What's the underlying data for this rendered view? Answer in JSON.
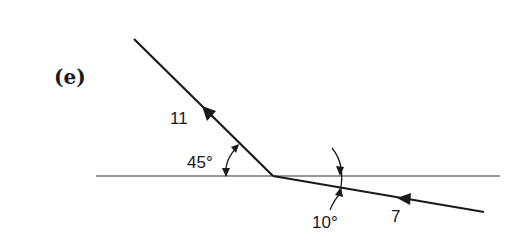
{
  "figure": {
    "part_label": "(e)",
    "colors": {
      "ink": "#1a1a1a",
      "background": "#ffffff"
    },
    "boundary": {
      "x1": 96,
      "y1": 176,
      "x2": 500,
      "y2": 176
    },
    "incident_ray": {
      "x1": 134,
      "y1": 39,
      "x2": 273,
      "y2": 176,
      "label": "11",
      "arrow_direction": "up-left"
    },
    "refracted_ray": {
      "x1": 273,
      "y1": 176,
      "x2": 484,
      "y2": 212,
      "label": "7",
      "arrow_direction": "left"
    },
    "angles": [
      {
        "label": "45°",
        "between": "incident ray and boundary"
      },
      {
        "label": "10°",
        "between": "refracted ray and boundary"
      }
    ]
  }
}
